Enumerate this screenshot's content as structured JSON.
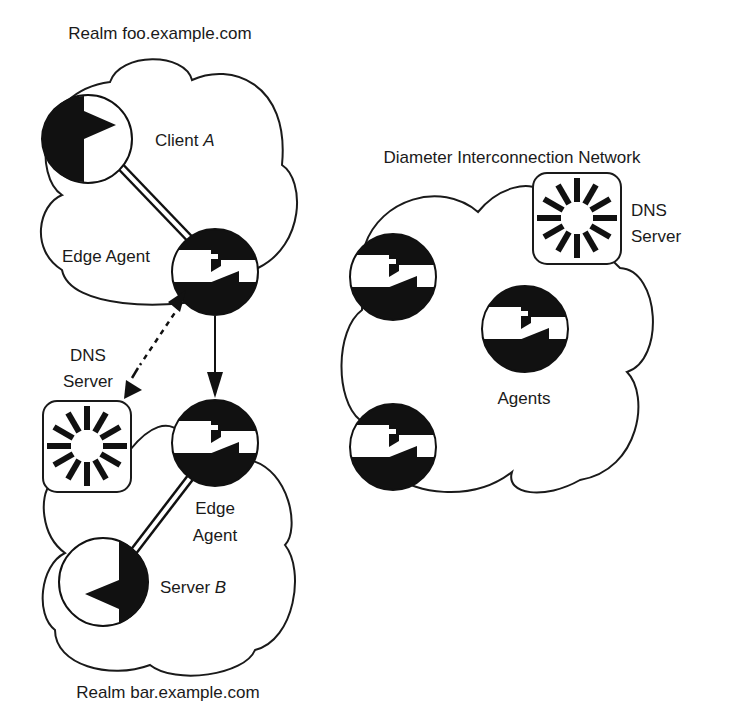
{
  "diagram": {
    "type": "network-topology",
    "colors": {
      "ink": "#111111",
      "background": "#ffffff"
    },
    "realm_foo": {
      "title": "Realm foo.example.com",
      "client": {
        "label": "Client ",
        "label_italic": "A",
        "icon": "client-pie-icon"
      },
      "edge_agent": {
        "label": "Edge Agent",
        "icon": "agent-relay-icon"
      }
    },
    "realm_bar": {
      "title": "Realm bar.example.com",
      "server": {
        "label": "Server ",
        "label_italic": "B",
        "icon": "server-pie-icon"
      },
      "edge_agent": {
        "label_line1": "Edge",
        "label_line2": "Agent",
        "icon": "agent-relay-icon"
      },
      "dns_server": {
        "label_line1": "DNS",
        "label_line2": "Server",
        "icon": "dns-starburst-icon"
      }
    },
    "interconnection": {
      "title": "Diameter Interconnection Network",
      "agents_label": "Agents",
      "agent_count": 3,
      "dns_server": {
        "label_line1": "DNS",
        "label_line2": "Server",
        "icon": "dns-starburst-icon"
      }
    },
    "connections": [
      {
        "from": "client_a",
        "to": "edge_agent_foo",
        "style": "double-line"
      },
      {
        "from": "edge_agent_foo",
        "to": "edge_agent_bar",
        "style": "solid-arrow"
      },
      {
        "from": "edge_agent_foo",
        "to": "dns_server_bar",
        "style": "dashed-bidirectional-arrow"
      },
      {
        "from": "server_b",
        "to": "edge_agent_bar",
        "style": "double-line"
      }
    ]
  }
}
